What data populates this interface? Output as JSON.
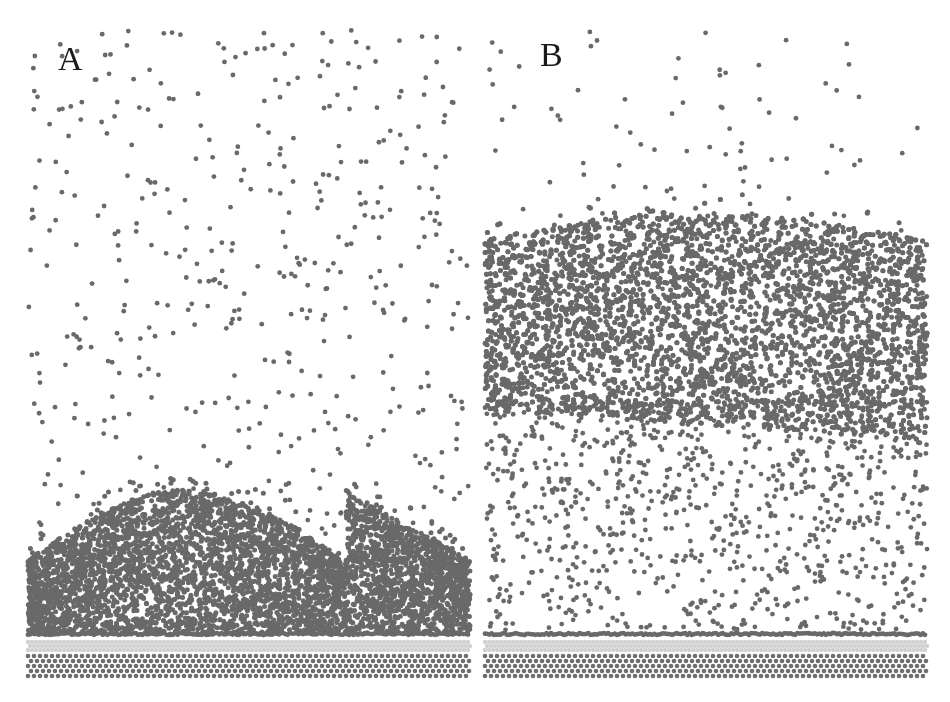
{
  "figure": {
    "dot_color": "#696969",
    "substrate_light_color": "#d2d2d2",
    "substrate_dark_color": "#6e6e6e",
    "panels": [
      {
        "label": "A",
        "label_x": 58,
        "label_y": 70,
        "x": 28,
        "width": 442,
        "top": 30,
        "substrate_top": 634,
        "vapor_count": 520,
        "dense_region": {
          "top_left": 560,
          "top_peak": 490,
          "top_right": 560,
          "bottom": 634,
          "count": 5200
        },
        "wetting_layer": {
          "y": 634,
          "count": 260
        }
      },
      {
        "label": "B",
        "label_x": 540,
        "label_y": 66,
        "x": 485,
        "width": 442,
        "top": 30,
        "substrate_top": 634,
        "vapor_count": 260,
        "dense_region": {
          "top_left": 240,
          "top_peak": 212,
          "top_right": 240,
          "bottom": 410,
          "bottom_right": 440,
          "count": 5800
        },
        "mid_scatter": {
          "top": 400,
          "bottom": 630,
          "count": 900
        },
        "wetting_layer": {
          "y": 634,
          "count": 260
        }
      }
    ]
  }
}
